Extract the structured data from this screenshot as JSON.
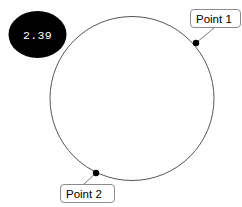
{
  "canvas": {
    "width": 242,
    "height": 207,
    "background": "#ffffff"
  },
  "badge": {
    "value": "2.39",
    "fill_color": "#000000",
    "text_color": "#ffffff",
    "cx": 37.5,
    "cy": 34.5,
    "rx": 29,
    "ry": 23.5
  },
  "circle": {
    "cx": 132,
    "cy": 98.5,
    "r": 82,
    "stroke_color": "#565656"
  },
  "annotations": [
    {
      "id": "point-1",
      "label": "Point 1",
      "dot_x": 196,
      "dot_y": 43,
      "leader_x2": 214,
      "leader_y2": 28,
      "box_x": 190.5,
      "box_y": 9.5,
      "box_w": 50,
      "box_h": 18,
      "text_x": 196,
      "text_y": 22.5
    },
    {
      "id": "point-2",
      "label": "Point 2",
      "dot_x": 96,
      "dot_y": 173,
      "leader_x2": 84,
      "leader_y2": 184,
      "box_x": 60.5,
      "box_y": 184.5,
      "box_w": 54,
      "box_h": 18,
      "text_x": 66,
      "text_y": 197.5
    }
  ]
}
